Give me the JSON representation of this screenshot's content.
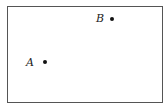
{
  "diagram": {
    "points": [
      {
        "label": "A",
        "x": 45,
        "y": 62
      },
      {
        "label": "B",
        "x": 112,
        "y": 19
      }
    ],
    "colors": {
      "border": "#555555",
      "point": "#111111",
      "background": "#ffffff"
    }
  }
}
